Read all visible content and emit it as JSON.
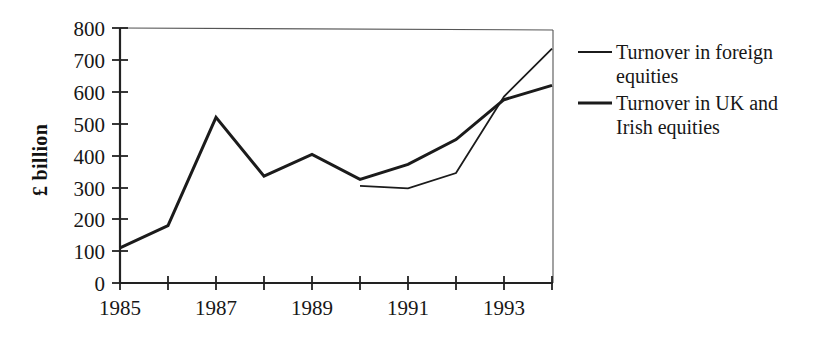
{
  "chart_data": {
    "type": "line",
    "title": "",
    "xlabel": "",
    "ylabel": "£ billion",
    "x": [
      1985,
      1986,
      1987,
      1988,
      1989,
      1990,
      1991,
      1992,
      1993,
      1994
    ],
    "x_tick_labels": [
      "1985",
      "",
      "1987",
      "",
      "1989",
      "",
      "1991",
      "",
      "1993",
      ""
    ],
    "xlim": [
      1985,
      1994
    ],
    "ylim": [
      0,
      800
    ],
    "y_ticks": [
      0,
      100,
      200,
      300,
      400,
      500,
      600,
      700,
      800
    ],
    "y_tick_labels": [
      "0",
      "100",
      "200",
      "300",
      "400",
      "500",
      "600",
      "700",
      "800"
    ],
    "grid": false,
    "legend_position": "right",
    "series": [
      {
        "name": "Turnover in foreign equities",
        "x": [
          1990,
          1991,
          1992,
          1993,
          1994
        ],
        "values": [
          305,
          297,
          345,
          585,
          735
        ],
        "color": "#1b1b1b",
        "line_width": 1.8
      },
      {
        "name": "Turnover in UK and Irish equities",
        "x": [
          1985,
          1986,
          1987,
          1988,
          1989,
          1990,
          1991,
          1992,
          1993,
          1994
        ],
        "values": [
          110,
          180,
          520,
          335,
          403,
          325,
          372,
          450,
          575,
          620
        ],
        "color": "#1b1b1b",
        "line_width": 3.0
      }
    ]
  },
  "axis": {
    "y_label": "£ billion",
    "y_tick_labels": [
      "800",
      "700",
      "600",
      "500",
      "400",
      "300",
      "200",
      "100",
      "0"
    ],
    "x_tick_labels": [
      "1985",
      "1987",
      "1989",
      "1991",
      "1993"
    ]
  },
  "legend": {
    "entries": [
      {
        "label_line1": "Turnover in foreign",
        "label_line2": "equities"
      },
      {
        "label_line1": "Turnover in UK and",
        "label_line2": "Irish equities"
      }
    ]
  },
  "colors": {
    "ink": "#1b1b1b",
    "frame": "#555555",
    "background": "#ffffff"
  }
}
